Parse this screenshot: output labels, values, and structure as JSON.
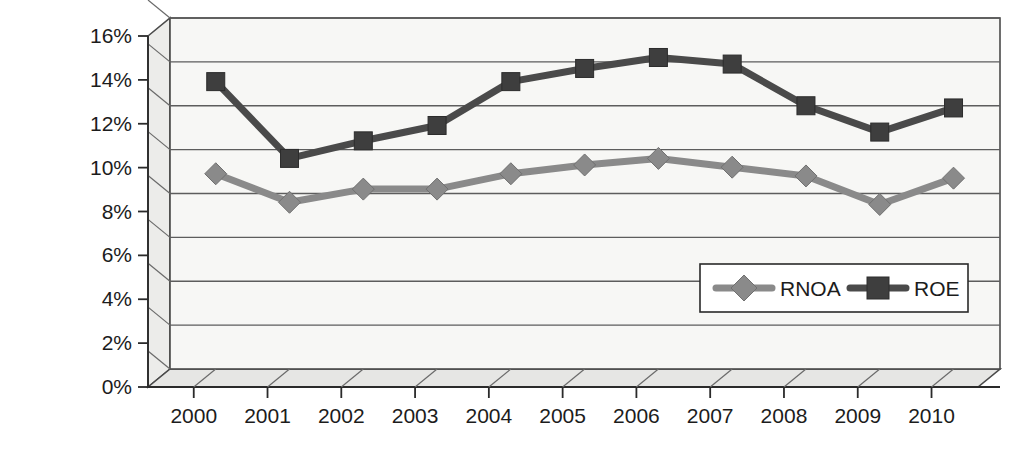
{
  "chart_data": {
    "type": "line",
    "title": "",
    "subtitle": "",
    "xlabel": "",
    "ylabel": "",
    "categories": [
      "2000",
      "2001",
      "2002",
      "2003",
      "2004",
      "2005",
      "2006",
      "2007",
      "2008",
      "2009",
      "2010"
    ],
    "ylim": [
      0,
      16
    ],
    "ytick_labels": [
      "0%",
      "2%",
      "4%",
      "6%",
      "8%",
      "10%",
      "12%",
      "14%",
      "16%"
    ],
    "ytick_values": [
      0,
      2,
      4,
      6,
      8,
      10,
      12,
      14,
      16
    ],
    "grid": true,
    "grid_axis": "y",
    "legend_position": "inside-lower-right",
    "value_unit": "percent",
    "style": "3d-line-chart",
    "series": [
      {
        "name": "RNOA",
        "marker": "diamond",
        "color": "#8a8a8a",
        "values": [
          8.9,
          7.6,
          8.2,
          8.2,
          8.9,
          9.3,
          9.6,
          9.2,
          8.8,
          7.5,
          8.7
        ]
      },
      {
        "name": "ROE",
        "marker": "square",
        "color": "#3e3e3e",
        "values": [
          13.1,
          9.6,
          10.4,
          11.1,
          13.1,
          13.7,
          14.2,
          13.9,
          12.0,
          10.8,
          11.9
        ]
      }
    ]
  },
  "legend": {
    "entries": [
      {
        "label": "RNOA",
        "marker": "diamond-marker-icon"
      },
      {
        "label": "ROE",
        "marker": "square-marker-icon"
      }
    ]
  },
  "colors": {
    "rnoa": "#8a8a8a",
    "roe": "#3e3e3e",
    "grid": "#5d5d5d",
    "axis": "#2a2a2a",
    "plot_background": "#f7f7f5",
    "side_wall": "#ececea",
    "floor": "#e6e6e4",
    "text": "#1c1c1c"
  }
}
